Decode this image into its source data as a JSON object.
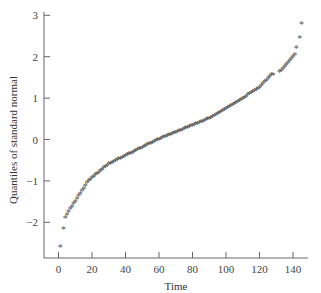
{
  "chart_data": {
    "type": "scatter",
    "title": "",
    "xlabel": "Time",
    "ylabel": "Quantiles of standard normal",
    "xlim": [
      -8,
      150
    ],
    "ylim": [
      -2.85,
      3.0
    ],
    "xticks": [
      0,
      20,
      40,
      60,
      80,
      100,
      120,
      140
    ],
    "yticks": [
      -2,
      -1,
      0,
      1,
      2,
      3
    ],
    "grid": false,
    "legend": null,
    "marker": "*",
    "n_points": 143,
    "gap_x": [
      128,
      132
    ],
    "anchor_points": [
      {
        "x": 1,
        "y": -2.6
      },
      {
        "x": 3,
        "y": -2.15
      },
      {
        "x": 4,
        "y": -1.9
      },
      {
        "x": 6,
        "y": -1.75
      },
      {
        "x": 10,
        "y": -1.5
      },
      {
        "x": 18,
        "y": -1.0
      },
      {
        "x": 30,
        "y": -0.6
      },
      {
        "x": 45,
        "y": -0.3
      },
      {
        "x": 60,
        "y": 0.0
      },
      {
        "x": 75,
        "y": 0.25
      },
      {
        "x": 90,
        "y": 0.5
      },
      {
        "x": 105,
        "y": 0.85
      },
      {
        "x": 120,
        "y": 1.25
      },
      {
        "x": 127,
        "y": 1.55
      },
      {
        "x": 133,
        "y": 1.65
      },
      {
        "x": 138,
        "y": 1.9
      },
      {
        "x": 141,
        "y": 2.05
      },
      {
        "x": 142,
        "y": 2.2
      },
      {
        "x": 144,
        "y": 2.45
      },
      {
        "x": 145,
        "y": 2.8
      }
    ]
  }
}
